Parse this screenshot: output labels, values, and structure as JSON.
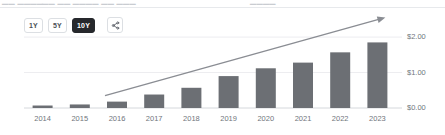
{
  "top_strip": {
    "ghost_left": "▁▁  ▁▁▁▁",
    "ghost_mid": "▁▁ ▁▁ ▁▁▁▁ ▁▁  ▁▁▁",
    "ghost_right": "▁▁▁▁"
  },
  "toolbar": {
    "ranges": [
      {
        "label": "1Y",
        "active": false,
        "name": "range-1y"
      },
      {
        "label": "5Y",
        "active": false,
        "name": "range-5y"
      },
      {
        "label": "10Y",
        "active": true,
        "name": "range-10y"
      }
    ],
    "share_icon": "share-icon"
  },
  "colors": {
    "bar": "#6c6f74",
    "trendline": "#8a8d93",
    "gridline": "#ededf0",
    "axis": "#d5d8dc",
    "label": "#70757c",
    "active_button_bg": "#26282c"
  },
  "chart_data": {
    "type": "bar",
    "title": "",
    "xlabel": "",
    "ylabel": "",
    "categories": [
      "2014",
      "2015",
      "2016",
      "2017",
      "2018",
      "2019",
      "2020",
      "2021",
      "2022",
      "2023"
    ],
    "values": [
      0.07,
      0.1,
      0.18,
      0.38,
      0.57,
      0.9,
      1.12,
      1.28,
      1.57,
      1.85
    ],
    "ylim": [
      0,
      2.2
    ],
    "yticks": [
      0,
      1,
      2
    ],
    "ytick_labels": [
      "$0.00",
      "$1.00",
      "$2.00"
    ],
    "grid": true,
    "legend": null,
    "annotations": [
      {
        "type": "arrow",
        "name": "trend-arrow",
        "from": {
          "x_category": "2016",
          "y_value": 0.35
        },
        "to": {
          "x_category": "2023",
          "y_value": 2.55
        }
      }
    ]
  }
}
